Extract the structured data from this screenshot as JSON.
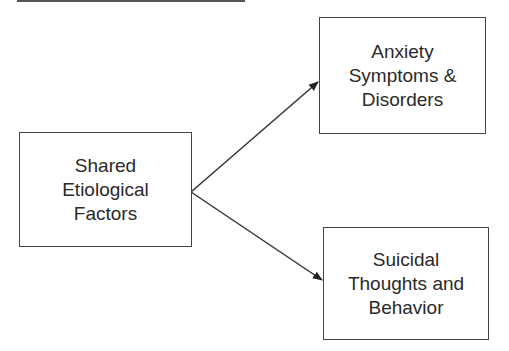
{
  "diagram": {
    "nodes": [
      {
        "id": "shared",
        "lines": [
          "Shared",
          "Etiological",
          "Factors"
        ]
      },
      {
        "id": "anxiety",
        "lines": [
          "Anxiety",
          "Symptoms &",
          "Disorders"
        ]
      },
      {
        "id": "suicidal",
        "lines": [
          "Suicidal",
          "Thoughts and",
          "Behavior"
        ]
      }
    ],
    "edges": [
      {
        "from": "shared",
        "to": "anxiety"
      },
      {
        "from": "shared",
        "to": "suicidal"
      }
    ]
  }
}
